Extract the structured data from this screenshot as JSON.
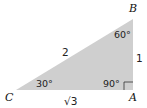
{
  "diagram": {
    "type": "right-triangle",
    "fill_color": "#cfcfcf",
    "vertices": {
      "A": {
        "label": "A",
        "x": 133,
        "y": 90
      },
      "B": {
        "label": "B",
        "x": 133,
        "y": 19
      },
      "C": {
        "label": "C",
        "x": 16,
        "y": 90
      }
    },
    "angles": {
      "A": "90°",
      "B": "60°",
      "C": "30°"
    },
    "sides": {
      "AB": "1",
      "BC": "2",
      "CA": "√3"
    }
  }
}
